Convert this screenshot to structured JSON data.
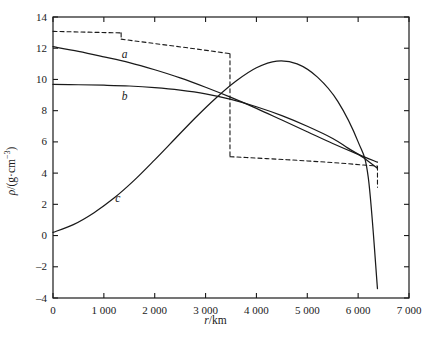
{
  "chart_data": {
    "type": "line",
    "title": "",
    "xlabel": "r/km",
    "ylabel": "ρ/(g·cm⁻³)",
    "xlim": [
      0,
      7000
    ],
    "ylim": [
      -4,
      14
    ],
    "xticks": [
      0,
      1000,
      2000,
      3000,
      4000,
      5000,
      6000,
      7000
    ],
    "xticklabels": [
      "0",
      "1 000",
      "2 000",
      "3 000",
      "4 000",
      "5 000",
      "6 000",
      "7 000"
    ],
    "yticks": [
      -4,
      -2,
      0,
      2,
      4,
      6,
      8,
      10,
      12,
      14
    ],
    "yticklabels": [
      "-4",
      "-2",
      "0",
      "2",
      "4",
      "6",
      "8",
      "10",
      "12",
      "14"
    ],
    "grid": false,
    "legend": "inline-curve-labels",
    "series": [
      {
        "name": "reference-dashed",
        "label": "",
        "style": "dashed",
        "color": "#1a1a1a",
        "points": [
          [
            0,
            13.08
          ],
          [
            400,
            13.05
          ],
          [
            800,
            13.02
          ],
          [
            1200,
            12.99
          ],
          [
            1340,
            12.98
          ],
          [
            1340,
            12.58
          ],
          [
            1600,
            12.47
          ],
          [
            2000,
            12.3
          ],
          [
            2400,
            12.13
          ],
          [
            2800,
            11.96
          ],
          [
            3200,
            11.78
          ],
          [
            3480,
            11.65
          ],
          [
            3480,
            5.05
          ],
          [
            3800,
            5.0
          ],
          [
            4200,
            4.93
          ],
          [
            4600,
            4.86
          ],
          [
            5000,
            4.78
          ],
          [
            5400,
            4.7
          ],
          [
            5800,
            4.6
          ],
          [
            6100,
            4.52
          ],
          [
            6380,
            4.45
          ],
          [
            6380,
            3.1
          ]
        ]
      },
      {
        "name": "curve-a",
        "label": "a",
        "style": "solid",
        "color": "#1a1a1a",
        "points": [
          [
            0,
            12.1
          ],
          [
            500,
            11.8
          ],
          [
            1000,
            11.45
          ],
          [
            1500,
            11.08
          ],
          [
            2000,
            10.62
          ],
          [
            2500,
            10.1
          ],
          [
            3000,
            9.5
          ],
          [
            3500,
            8.85
          ],
          [
            4000,
            8.15
          ],
          [
            4500,
            7.4
          ],
          [
            5000,
            6.65
          ],
          [
            5500,
            5.9
          ],
          [
            6000,
            5.2
          ],
          [
            6380,
            4.7
          ]
        ]
      },
      {
        "name": "curve-b",
        "label": "b",
        "style": "solid",
        "color": "#1a1a1a",
        "points": [
          [
            0,
            9.68
          ],
          [
            500,
            9.66
          ],
          [
            1000,
            9.63
          ],
          [
            1500,
            9.58
          ],
          [
            2000,
            9.48
          ],
          [
            2500,
            9.32
          ],
          [
            3000,
            9.08
          ],
          [
            3500,
            8.72
          ],
          [
            4000,
            8.25
          ],
          [
            4500,
            7.68
          ],
          [
            5000,
            7.0
          ],
          [
            5500,
            6.22
          ],
          [
            5800,
            5.6
          ],
          [
            6100,
            5.0
          ],
          [
            6380,
            4.3
          ]
        ]
      },
      {
        "name": "curve-c",
        "label": "c",
        "style": "solid",
        "color": "#1a1a1a",
        "points": [
          [
            0,
            0.2
          ],
          [
            400,
            0.7
          ],
          [
            800,
            1.45
          ],
          [
            1200,
            2.4
          ],
          [
            1600,
            3.55
          ],
          [
            2000,
            4.85
          ],
          [
            2400,
            6.2
          ],
          [
            2800,
            7.55
          ],
          [
            3200,
            8.8
          ],
          [
            3600,
            9.9
          ],
          [
            4000,
            10.75
          ],
          [
            4400,
            11.18
          ],
          [
            4800,
            11.0
          ],
          [
            5200,
            10.15
          ],
          [
            5600,
            8.6
          ],
          [
            6000,
            6.0
          ],
          [
            6200,
            3.7
          ],
          [
            6380,
            -3.4
          ]
        ]
      }
    ],
    "curve_labels": [
      {
        "text": "a",
        "x": 1450,
        "y": 11.55
      },
      {
        "text": "b",
        "x": 1450,
        "y": 8.9
      },
      {
        "text": "c",
        "x": 1320,
        "y": 2.35
      }
    ]
  },
  "axes": {
    "x_title": "r/km",
    "y_title_prefix": "ρ/(g·cm",
    "y_title_exp": "−3",
    "y_title_suffix": ")"
  }
}
